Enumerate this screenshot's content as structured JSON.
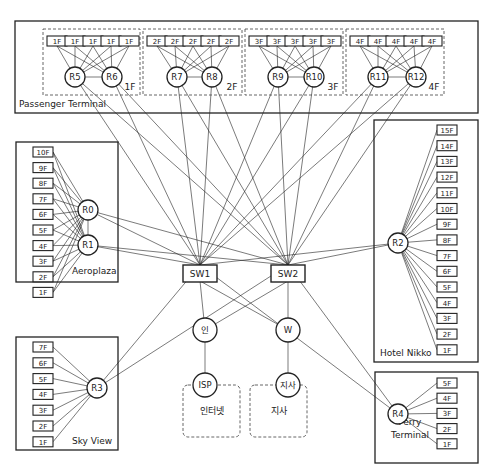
{
  "diagram": {
    "title_cropped": "",
    "colors": {
      "line": "#222222",
      "dashed": "#555555",
      "background": "#ffffff"
    },
    "buildings": [
      {
        "id": "passenger-terminal",
        "label": "Passenger Terminal",
        "rect": [
          15,
          21,
          463,
          92
        ],
        "label_pos": [
          19,
          107
        ]
      },
      {
        "id": "aeroplaza",
        "label": "Aeroplaza",
        "rect": [
          16,
          142,
          102,
          140
        ],
        "label_pos": [
          72,
          274
        ]
      },
      {
        "id": "hotel-nikko",
        "label": "Hotel Nikko",
        "rect": [
          374,
          120,
          104,
          242
        ],
        "label_pos": [
          380,
          356
        ]
      },
      {
        "id": "sky-view",
        "label": "Sky View",
        "rect": [
          16,
          337,
          102,
          113
        ],
        "label_pos": [
          72,
          444
        ]
      },
      {
        "id": "ferry-terminal",
        "label": "Ferry\nTerminal",
        "label_lines": [
          "Ferry",
          "Terminal"
        ],
        "rect": [
          375,
          372,
          103,
          91
        ],
        "label_pos": [
          400,
          437
        ]
      }
    ],
    "floor_groups": [
      {
        "label": "1F",
        "rect": [
          43,
          29,
          97,
          66
        ],
        "floor_label": "1F",
        "floors_x": [
          47,
          65,
          83,
          101,
          119
        ],
        "routers": [
          "R5",
          "R6"
        ]
      },
      {
        "label": "2F",
        "rect": [
          143,
          29,
          99,
          66
        ],
        "floor_label": "2F",
        "floors_x": [
          147,
          165,
          183,
          201,
          219
        ],
        "routers": [
          "R7",
          "R8"
        ]
      },
      {
        "label": "3F",
        "rect": [
          245,
          29,
          98,
          66
        ],
        "floor_label": "3F",
        "floors_x": [
          249,
          267,
          285,
          303,
          321
        ],
        "routers": [
          "R9",
          "R10"
        ]
      },
      {
        "label": "4F",
        "rect": [
          346,
          29,
          98,
          66
        ],
        "floor_label": "4F",
        "floors_x": [
          350,
          368,
          386,
          404,
          422
        ],
        "routers": [
          "R11",
          "R12"
        ]
      }
    ],
    "routers": [
      {
        "id": "R0",
        "label": "R0",
        "x": 88,
        "y": 210
      },
      {
        "id": "R1",
        "label": "R1",
        "x": 88,
        "y": 245
      },
      {
        "id": "R2",
        "label": "R2",
        "x": 398,
        "y": 243
      },
      {
        "id": "R3",
        "label": "R3",
        "x": 97,
        "y": 388
      },
      {
        "id": "R4",
        "label": "R4",
        "x": 398,
        "y": 414
      },
      {
        "id": "R5",
        "label": "R5",
        "x": 75,
        "y": 77
      },
      {
        "id": "R6",
        "label": "R6",
        "x": 112,
        "y": 77
      },
      {
        "id": "R7",
        "label": "R7",
        "x": 177,
        "y": 77
      },
      {
        "id": "R8",
        "label": "R8",
        "x": 212,
        "y": 77
      },
      {
        "id": "R9",
        "label": "R9",
        "x": 278,
        "y": 77
      },
      {
        "id": "R10",
        "label": "R10",
        "x": 314,
        "y": 77
      },
      {
        "id": "R11",
        "label": "R11",
        "x": 378,
        "y": 77
      },
      {
        "id": "R12",
        "label": "R12",
        "x": 416,
        "y": 77
      }
    ],
    "switches": [
      {
        "id": "SW1",
        "label": "SW1",
        "x": 200,
        "y": 273
      },
      {
        "id": "SW2",
        "label": "SW2",
        "x": 288,
        "y": 273
      }
    ],
    "edge_nodes": [
      {
        "id": "in",
        "label": "인",
        "x": 205,
        "y": 330
      },
      {
        "id": "W",
        "label": "W",
        "x": 288,
        "y": 330
      },
      {
        "id": "ISP",
        "label": "ISP",
        "x": 205,
        "y": 385
      },
      {
        "id": "branch",
        "label": "지사",
        "x": 288,
        "y": 385
      }
    ],
    "clouds": [
      {
        "id": "internet",
        "label": "인터넷",
        "rect": [
          183,
          385,
          57,
          52
        ],
        "label_y": 414
      },
      {
        "id": "branch-office",
        "label": "지사",
        "rect": [
          250,
          385,
          57,
          52
        ],
        "label_y": 414
      }
    ],
    "aeroplaza_floors": [
      "10F",
      "9F",
      "8F",
      "7F",
      "6F",
      "5F",
      "4F",
      "3F",
      "2F",
      "1F"
    ],
    "hotel_floors": [
      "15F",
      "14F",
      "13F",
      "12F",
      "11F",
      "10F",
      "9F",
      "8F",
      "7F",
      "6F",
      "5F",
      "4F",
      "3F",
      "2F",
      "1F"
    ],
    "skyview_floors": [
      "7F",
      "6F",
      "5F",
      "4F",
      "3F",
      "2F",
      "1F"
    ],
    "ferry_floors": [
      "5F",
      "4F",
      "3F",
      "2F",
      "1F"
    ]
  }
}
